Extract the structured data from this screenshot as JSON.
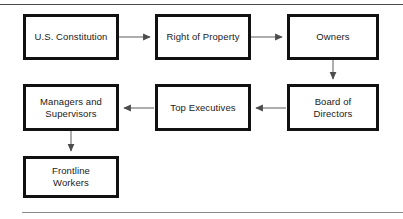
{
  "figure": {
    "title": "",
    "top_rule": "horizontal-rule",
    "bottom_rule": "horizontal-rule",
    "box_border_color": "#111111",
    "box_fill_color": "#ffffff",
    "connector_color": "#6b6b6b",
    "text_color": "#1a1a1a"
  },
  "nodes": [
    {
      "id": "us-constitution",
      "label": "U.S. Constitution",
      "x": 23,
      "y": 14,
      "w": 96,
      "h": 46
    },
    {
      "id": "right-of-property",
      "label": "Right of Property",
      "x": 155,
      "y": 14,
      "w": 96,
      "h": 46
    },
    {
      "id": "owners",
      "label": "Owners",
      "x": 287,
      "y": 14,
      "w": 92,
      "h": 46
    },
    {
      "id": "board-of-directors",
      "label": "Board of\nDirectors",
      "x": 287,
      "y": 84,
      "w": 92,
      "h": 47
    },
    {
      "id": "top-executives",
      "label": "Top Executives",
      "x": 155,
      "y": 84,
      "w": 96,
      "h": 47
    },
    {
      "id": "managers-and-supervisors",
      "label": "Managers and\nSupervisors",
      "x": 23,
      "y": 84,
      "w": 96,
      "h": 47
    },
    {
      "id": "frontline-workers",
      "label": "Frontline\nWorkers",
      "x": 23,
      "y": 156,
      "w": 96,
      "h": 42
    }
  ],
  "connectors": [
    {
      "id": "constitution-to-property",
      "from": "us-constitution",
      "to": "right-of-property",
      "direction": "right"
    },
    {
      "id": "property-to-owners",
      "from": "right-of-property",
      "to": "owners",
      "direction": "right"
    },
    {
      "id": "owners-to-board",
      "from": "owners",
      "to": "board-of-directors",
      "direction": "down"
    },
    {
      "id": "board-to-executives",
      "from": "board-of-directors",
      "to": "top-executives",
      "direction": "left"
    },
    {
      "id": "executives-to-managers",
      "from": "top-executives",
      "to": "managers-and-supervisors",
      "direction": "left"
    },
    {
      "id": "managers-to-frontline",
      "from": "managers-and-supervisors",
      "to": "frontline-workers",
      "direction": "down"
    }
  ]
}
